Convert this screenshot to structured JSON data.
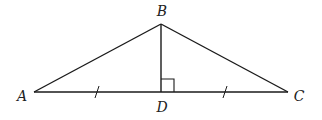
{
  "diagram": {
    "type": "geometry-triangle",
    "stroke_color": "#1a1a1a",
    "label_color": "#222222",
    "points": {
      "A": {
        "label": "A",
        "x": 34,
        "y": 92,
        "label_x": 22,
        "label_y": 96
      },
      "B": {
        "label": "B",
        "x": 161,
        "y": 24,
        "label_x": 162,
        "label_y": 11
      },
      "C": {
        "label": "C",
        "x": 288,
        "y": 92,
        "label_x": 299,
        "label_y": 96
      },
      "D": {
        "label": "D",
        "x": 161,
        "y": 92,
        "label_x": 162,
        "label_y": 107
      }
    },
    "segments": [
      {
        "name": "AB",
        "from": "A",
        "to": "B"
      },
      {
        "name": "BC",
        "from": "B",
        "to": "C"
      },
      {
        "name": "AC",
        "from": "A",
        "to": "C"
      },
      {
        "name": "BD",
        "from": "B",
        "to": "D"
      }
    ],
    "right_angle": {
      "at": "D",
      "size": 13
    },
    "tick_marks": [
      {
        "segment": "AD",
        "x": 97,
        "y": 92
      },
      {
        "segment": "DC",
        "x": 225,
        "y": 92
      }
    ]
  }
}
